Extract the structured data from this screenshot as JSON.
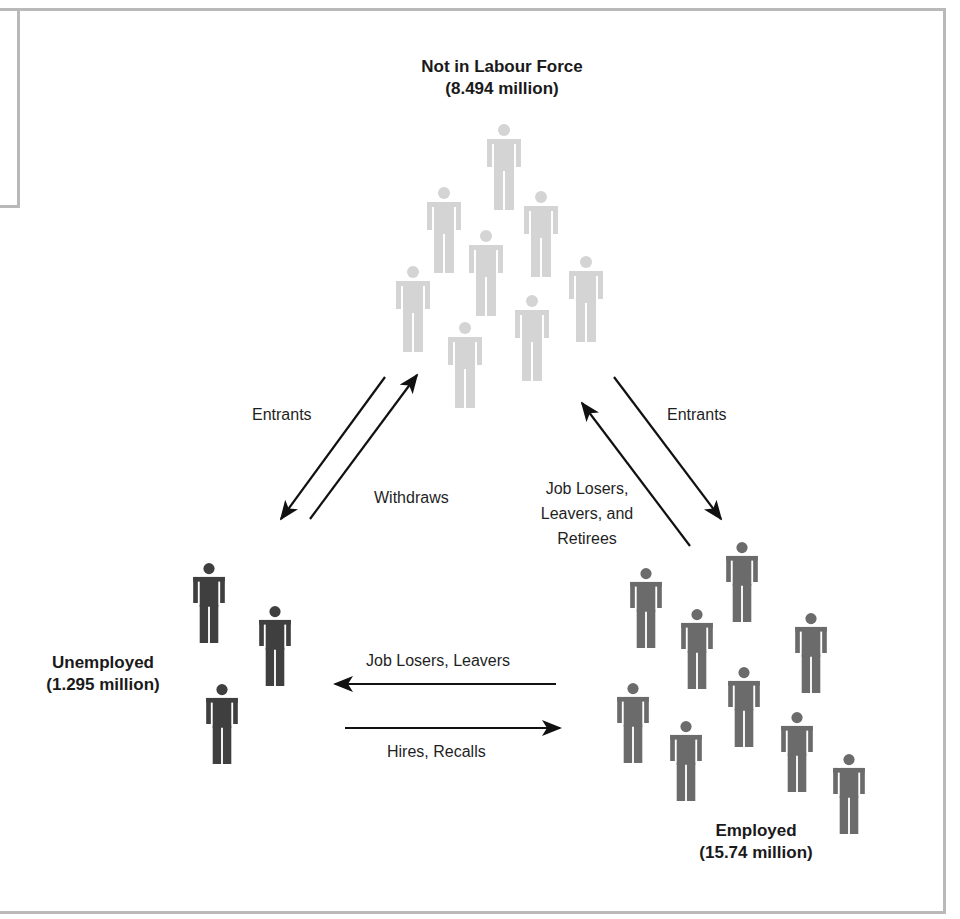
{
  "diagram": {
    "colors": {
      "not_in_labour_force": "#d4d4d4",
      "unemployed": "#3f3f3f",
      "employed": "#6b6b6b",
      "arrow": "#111111",
      "frame": "#b9b9b9"
    },
    "groups": {
      "not_in_labour_force": {
        "name": "Not in Labour Force",
        "value": "(8.494 million)",
        "figure_count": 8
      },
      "unemployed": {
        "name": "Unemployed",
        "value": "(1.295 million)",
        "figure_count": 3
      },
      "employed": {
        "name": "Employed",
        "value": "(15.74 million)",
        "figure_count": 9
      }
    },
    "flows": [
      {
        "id": "nilf-to-unemployed",
        "label": "Entrants",
        "from": "Not in Labour Force",
        "to": "Unemployed"
      },
      {
        "id": "unemployed-to-nilf",
        "label": "Withdraws",
        "from": "Unemployed",
        "to": "Not in Labour Force"
      },
      {
        "id": "nilf-to-employed",
        "label": "Entrants",
        "from": "Not in Labour Force",
        "to": "Employed"
      },
      {
        "id": "employed-to-nilf",
        "label_lines": [
          "Job Losers,",
          "Leavers, and",
          "Retirees"
        ],
        "from": "Employed",
        "to": "Not in Labour Force"
      },
      {
        "id": "employed-to-unemployed",
        "label": "Job Losers, Leavers",
        "from": "Employed",
        "to": "Unemployed"
      },
      {
        "id": "unemployed-to-employed",
        "label": "Hires, Recalls",
        "from": "Unemployed",
        "to": "Employed"
      }
    ]
  }
}
